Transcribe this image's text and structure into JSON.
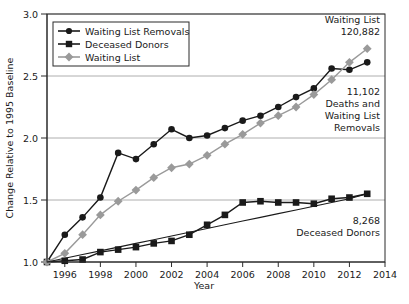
{
  "chart_data": {
    "type": "line",
    "title": "",
    "xlabel": "Year",
    "ylabel": "Change Relative to 1995 Baseline",
    "xlim": [
      1995,
      2014
    ],
    "ylim": [
      1.0,
      3.0
    ],
    "grid": true,
    "legend_position": "top-left",
    "x_ticks": [
      1996,
      1998,
      2000,
      2002,
      2004,
      2006,
      2008,
      2010,
      2012,
      2014
    ],
    "y_ticks": [
      "1.0",
      "1.5",
      "2.0",
      "2.5",
      "3.0"
    ],
    "x": [
      1995,
      1996,
      1997,
      1998,
      1999,
      2000,
      2001,
      2002,
      2003,
      2004,
      2005,
      2006,
      2007,
      2008,
      2009,
      2010,
      2011,
      2012,
      2013
    ],
    "series": [
      {
        "name": "Waiting List Removals",
        "marker": "circle",
        "color": "#1a1a1a",
        "values": [
          1.0,
          1.22,
          1.36,
          1.52,
          1.88,
          1.83,
          1.95,
          2.07,
          2.0,
          2.02,
          2.08,
          2.14,
          2.18,
          2.25,
          2.33,
          2.4,
          2.56,
          2.55,
          2.61
        ]
      },
      {
        "name": "Deceased Donors",
        "marker": "square",
        "color": "#1a1a1a",
        "values": [
          1.0,
          1.01,
          1.02,
          1.08,
          1.1,
          1.12,
          1.15,
          1.17,
          1.22,
          1.3,
          1.38,
          1.48,
          1.49,
          1.48,
          1.48,
          1.47,
          1.51,
          1.52,
          1.55
        ]
      },
      {
        "name": "Waiting List",
        "marker": "diamond",
        "color": "#9a9a9a",
        "values": [
          1.0,
          1.07,
          1.22,
          1.38,
          1.49,
          1.58,
          1.68,
          1.76,
          1.79,
          1.86,
          1.95,
          2.03,
          2.12,
          2.18,
          2.25,
          2.35,
          2.47,
          2.61,
          2.72
        ]
      },
      {
        "name": "Deceased Donors Trend",
        "marker": "none",
        "color": "#1a1a1a",
        "values": [
          1.0,
          1.03,
          1.06,
          1.09,
          1.12,
          1.15,
          1.18,
          1.21,
          1.24,
          1.27,
          1.3,
          1.33,
          1.36,
          1.39,
          1.42,
          1.45,
          1.48,
          1.51,
          1.55
        ]
      }
    ],
    "annotations": [
      {
        "name": "waiting-list-annotation",
        "lines": [
          "Waiting List",
          "120,882"
        ]
      },
      {
        "name": "removals-annotation",
        "lines": [
          "11,102",
          "Deaths and",
          "Waiting List",
          "Removals"
        ]
      },
      {
        "name": "donors-annotation",
        "lines": [
          "8,268",
          "Deceased Donors"
        ]
      }
    ]
  }
}
